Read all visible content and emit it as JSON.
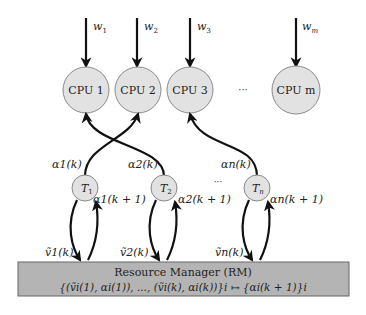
{
  "workloads": [
    {
      "name": "w",
      "sub": "1"
    },
    {
      "name": "w",
      "sub": "2"
    },
    {
      "name": "w",
      "sub": "3"
    },
    {
      "name": "w",
      "sub": "m"
    }
  ],
  "cpus": [
    {
      "label": "CPU 1"
    },
    {
      "label": "CPU 2"
    },
    {
      "label": "CPU 3"
    },
    {
      "label": "CPU m"
    }
  ],
  "cpu_ellipsis": "···",
  "tasks": [
    {
      "label": "T",
      "sub": "1",
      "alpha_k": "α1(k)",
      "alpha_next": "α1(k + 1)",
      "v_k": "ṽ1(k)"
    },
    {
      "label": "T",
      "sub": "2",
      "alpha_k": "α2(k)",
      "alpha_next": "α2(k + 1)",
      "v_k": "ṽ2(k)"
    },
    {
      "label": "T",
      "sub": "n",
      "alpha_k": "αn(k)",
      "alpha_next": "αn(k + 1)",
      "v_k": "ṽn(k)"
    }
  ],
  "task_ellipsis": "···",
  "resource_manager": {
    "title": "Resource Manager (RM)",
    "mapping": "{(ṽi(1), αi(1)), ..., (ṽi(k), αi(k))}i ↦ {αi(k + 1)}i"
  },
  "colors": {
    "node_fill": "#e2e2e2",
    "node_stroke": "#8a8a8a",
    "rm_fill": "#b4b4b4",
    "rm_stroke": "#666666",
    "arrow": "#111111"
  }
}
